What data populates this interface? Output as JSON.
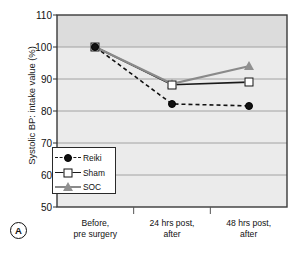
{
  "figure": {
    "panel_label": "A",
    "plot_bg_color": "#eaeaea",
    "plot_bg_upper_color": "#dcdcdc",
    "axis_color": "#333333",
    "grid_color": "#9a9a9a"
  },
  "chart_data": {
    "type": "line",
    "title": "",
    "xlabel": "",
    "ylabel": "Systolic BP: intake value (%)",
    "categories": [
      "Before,\npre surgery",
      "24 hrs post,\nafter",
      "48 hrs post,\nafter"
    ],
    "category_lines": [
      [
        "Before,",
        "pre surgery"
      ],
      [
        "24 hrs post,",
        "after"
      ],
      [
        "48 hrs post,",
        "after"
      ]
    ],
    "ylim": [
      50,
      110
    ],
    "yticks": [
      110,
      100,
      90,
      80,
      70,
      60,
      50
    ],
    "ytick_labels": [
      "110",
      "100",
      "90",
      "80",
      "70",
      "60",
      "50"
    ],
    "grid": true,
    "legend_position": "lower left",
    "series": [
      {
        "name": "Reiki",
        "values": [
          100,
          82.2,
          81.6
        ],
        "marker": "filled-circle",
        "linestyle": "dashed",
        "color": "#111111"
      },
      {
        "name": "Sham",
        "values": [
          100,
          88.2,
          89.0
        ],
        "marker": "open-square",
        "linestyle": "solid",
        "color": "#1a1a1a"
      },
      {
        "name": "SOC",
        "values": [
          100,
          88.5,
          94.0
        ],
        "marker": "filled-triangle",
        "linestyle": "solid",
        "color": "#8a8a8a"
      }
    ]
  }
}
